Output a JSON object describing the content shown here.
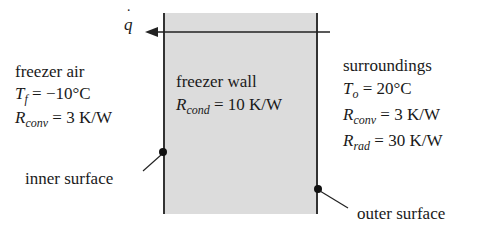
{
  "heat_flow": {
    "symbol": "q",
    "dot": "˙",
    "direction": "left"
  },
  "left_region": {
    "title": "freezer air",
    "temp": {
      "var": "T",
      "sub": "f",
      "eq": " = −10°C"
    },
    "rconv": {
      "var": "R",
      "sub": "conv",
      "eq": " = 3 K/W"
    }
  },
  "wall": {
    "title": "freezer wall",
    "rcond": {
      "var": "R",
      "sub": "cond",
      "eq": " = 10 K/W"
    },
    "fill_color": "#dcdcdc"
  },
  "right_region": {
    "title": "surroundings",
    "temp": {
      "var": "T",
      "sub": "o",
      "eq": " = 20°C"
    },
    "rconv": {
      "var": "R",
      "sub": "conv",
      "eq": " = 3 K/W"
    },
    "rrad": {
      "var": "R",
      "sub": "rad",
      "eq": " = 30 K/W"
    }
  },
  "labels": {
    "inner": "inner surface",
    "outer": "outer surface"
  }
}
